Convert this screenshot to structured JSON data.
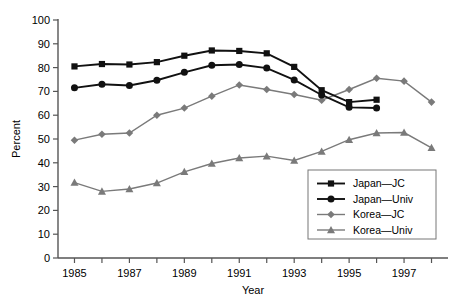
{
  "chart_data": {
    "type": "line",
    "title": "",
    "xlabel": "Year",
    "ylabel": "Percent",
    "xlim": [
      1984.4,
      1998.6
    ],
    "ylim": [
      0,
      100
    ],
    "grid": false,
    "legend_position": "bottom-right",
    "y_ticks": [
      "0",
      "10",
      "20",
      "30",
      "40",
      "50",
      "60",
      "70",
      "80",
      "90",
      "100"
    ],
    "y_tick_values": [
      0,
      10,
      20,
      30,
      40,
      50,
      60,
      70,
      80,
      90,
      100
    ],
    "x_ticks_all": [
      1985,
      1986,
      1987,
      1988,
      1989,
      1990,
      1991,
      1992,
      1993,
      1994,
      1995,
      1996,
      1997,
      1998
    ],
    "x_tick_labels": [
      "1985",
      "1987",
      "1989",
      "1991",
      "1993",
      "1995",
      "1997"
    ],
    "x_tick_label_values": [
      1985,
      1987,
      1989,
      1991,
      1993,
      1995,
      1997
    ],
    "series": [
      {
        "name": "Japan—JC",
        "marker": "square",
        "color": "#111111",
        "x": [
          1985,
          1986,
          1987,
          1988,
          1989,
          1990,
          1991,
          1992,
          1993,
          1994,
          1995,
          1996
        ],
        "values": [
          80.5,
          81.5,
          81.3,
          82.3,
          85.0,
          87.2,
          87.0,
          86.0,
          80.3,
          70.5,
          65.5,
          66.5
        ]
      },
      {
        "name": "Japan—Univ",
        "marker": "circle",
        "color": "#111111",
        "x": [
          1985,
          1986,
          1987,
          1988,
          1989,
          1990,
          1991,
          1992,
          1993,
          1994,
          1995,
          1996
        ],
        "values": [
          71.5,
          73.0,
          72.5,
          74.7,
          78.0,
          81.0,
          81.3,
          79.8,
          74.8,
          68.5,
          63.3,
          63.0
        ]
      },
      {
        "name": "Korea—JC",
        "marker": "diamond",
        "color": "#7a7a7a",
        "x": [
          1985,
          1986,
          1987,
          1988,
          1989,
          1990,
          1991,
          1992,
          1993,
          1994,
          1995,
          1996,
          1997,
          1998
        ],
        "values": [
          49.5,
          52.0,
          52.5,
          60.0,
          63.0,
          68.0,
          72.7,
          70.8,
          68.7,
          66.3,
          70.8,
          75.5,
          74.3,
          65.5
        ]
      },
      {
        "name": "Korea—Univ",
        "marker": "triangle",
        "color": "#7a7a7a",
        "x": [
          1985,
          1986,
          1987,
          1988,
          1989,
          1990,
          1991,
          1992,
          1993,
          1994,
          1995,
          1996,
          1997,
          1998
        ],
        "values": [
          31.7,
          28.0,
          29.0,
          31.5,
          36.2,
          39.7,
          42.0,
          42.8,
          41.0,
          44.8,
          49.7,
          52.5,
          52.7,
          46.3
        ]
      }
    ]
  },
  "legend": {
    "items": [
      {
        "label": "Japan—JC"
      },
      {
        "label": "Japan—Univ"
      },
      {
        "label": "Korea—JC"
      },
      {
        "label": "Korea—Univ"
      }
    ]
  },
  "colors": {
    "japan": "#111111",
    "korea": "#7a7a7a",
    "axis": "#555555",
    "legend_border": "#777777"
  }
}
